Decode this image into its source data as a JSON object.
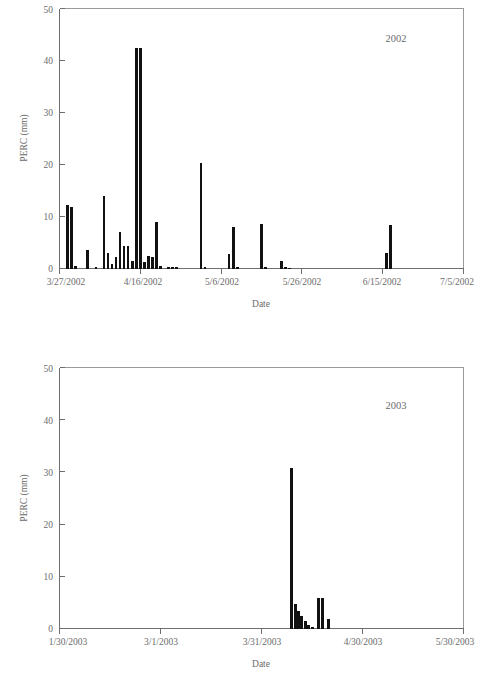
{
  "figure": {
    "background_color": "#ffffff",
    "line_color": "#6e6e6e",
    "bar_color": "#111111",
    "text_color": "#6b6b6b"
  },
  "chart_data": [
    {
      "type": "bar",
      "id": "perc-2002",
      "title": "",
      "annotation": "2002",
      "xlabel": "Date",
      "ylabel": "PERC (mm)",
      "ylim": [
        0,
        50
      ],
      "yticks": [
        0,
        10,
        20,
        30,
        40,
        50
      ],
      "ytick_labels": [
        "0",
        "10",
        "20",
        "30",
        "40",
        "50"
      ],
      "xtick_labels": [
        "3/27/2002",
        "4/16/2002",
        "5/6/2002",
        "5/26/2002",
        "6/15/2002",
        "7/5/2002"
      ],
      "xtick_dates": [
        "2002-03-27",
        "2002-04-16",
        "2002-05-06",
        "2002-05-26",
        "2002-06-15",
        "2002-07-05"
      ],
      "x_axis_days": [
        0,
        20,
        40,
        60,
        80,
        100
      ],
      "xlim_days": [
        0,
        100
      ],
      "grid": false,
      "legend": "none",
      "x_unit": "days since 3/27/2002",
      "categories": [
        2,
        3,
        4,
        7,
        9,
        11,
        12,
        13,
        14,
        15,
        16,
        17,
        18,
        19,
        20,
        21,
        22,
        23,
        24,
        25,
        27,
        28,
        29,
        35,
        36,
        42,
        43,
        44,
        50,
        51,
        55,
        56,
        57,
        81,
        82
      ],
      "values": [
        12.2,
        11.8,
        0.4,
        3.6,
        0.3,
        13.9,
        2.9,
        0.9,
        2.3,
        7.1,
        4.4,
        4.3,
        1.5,
        42.5,
        42.4,
        1.2,
        2.5,
        2.3,
        8.9,
        0.5,
        0.3,
        0.2,
        0.2,
        20.2,
        0.2,
        2.8,
        8.0,
        0.3,
        8.6,
        0.3,
        1.4,
        0.2,
        0.1,
        2.9,
        8.4
      ],
      "max_value": 42.5
    },
    {
      "type": "bar",
      "id": "perc-2003",
      "title": "",
      "annotation": "2003",
      "xlabel": "Date",
      "ylabel": "PERC (mm)",
      "ylim": [
        0,
        50
      ],
      "yticks": [
        0,
        10,
        20,
        30,
        40,
        50
      ],
      "ytick_labels": [
        "0",
        "10",
        "20",
        "30",
        "40",
        "50"
      ],
      "xtick_labels": [
        "1/30/2003",
        "3/1/2003",
        "3/31/2003",
        "4/30/2003",
        "5/30/2003"
      ],
      "xtick_dates": [
        "2003-01-30",
        "2003-03-01",
        "2003-03-31",
        "2003-04-30",
        "2003-05-30"
      ],
      "x_axis_days": [
        0,
        30,
        60,
        90,
        120
      ],
      "xlim_days": [
        0,
        120
      ],
      "grid": false,
      "legend": "none",
      "x_unit": "days since 1/30/2003",
      "categories": [
        69,
        70,
        71,
        72,
        73,
        74,
        75,
        77,
        78,
        80
      ],
      "values": [
        30.7,
        4.7,
        3.4,
        2.4,
        1.5,
        0.6,
        0.3,
        5.9,
        5.8,
        1.8
      ],
      "max_value": 30.7
    }
  ]
}
